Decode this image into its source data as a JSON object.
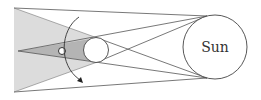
{
  "diagram": {
    "labels": {
      "sun": "Sun"
    },
    "elements": {
      "sun": {
        "cx": 215,
        "cy": 47,
        "r": 32
      },
      "moon": {
        "cx": 96,
        "cy": 50,
        "r": 12.5
      },
      "earth": {
        "cx": 62,
        "cy": 51,
        "r": 3.5
      },
      "penumbra": {
        "points": "14,8 95,37 95,63 14,92"
      },
      "umbra": {
        "points": "18,51 96,37.5 96,62.5"
      }
    },
    "colors": {
      "penumbra": "#dcdcdc",
      "umbra": "#b4b4b4",
      "lines": "#555555",
      "circle_fill": "#ffffff"
    }
  }
}
